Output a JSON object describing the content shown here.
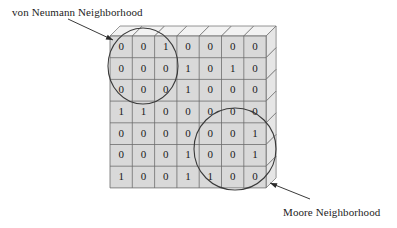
{
  "figure": {
    "type": "cellular-automaton-grid-diagram",
    "background_color": "#ffffff"
  },
  "annotations": {
    "von_neumann": {
      "label": "von Neumann Neighborhood",
      "circle": {
        "cx": 143,
        "cy": 66,
        "rx": 35,
        "ry": 38
      },
      "arrow": {
        "x1": 68,
        "y1": 19,
        "x2": 113,
        "y2": 40
      }
    },
    "moore": {
      "label": "Moore Neighborhood",
      "circle": {
        "cx": 235,
        "cy": 149,
        "rx": 41,
        "ry": 41
      },
      "arrow": {
        "x1": 310,
        "y1": 199,
        "x2": 270,
        "y2": 183
      }
    }
  },
  "grid": {
    "rows": 7,
    "cols": 7,
    "origin_x": 110,
    "origin_y": 36,
    "cell_w": 22.3,
    "cell_h": 21.7,
    "depth": 10,
    "cell_fill": "#d9d9d9",
    "top_face_fill": "#f2f2f2",
    "side_face_fill": "#e6e6e6",
    "stroke": "#6b6b6b",
    "values": [
      [
        "0",
        "0",
        "1",
        "0",
        "0",
        "0",
        "0"
      ],
      [
        "0",
        "0",
        "0",
        "1",
        "0",
        "1",
        "0"
      ],
      [
        "0",
        "0",
        "0",
        "1",
        "0",
        "0",
        "0"
      ],
      [
        "1",
        "1",
        "0",
        "0",
        "0",
        "0",
        "0"
      ],
      [
        "0",
        "0",
        "0",
        "0",
        "0",
        "0",
        "1"
      ],
      [
        "0",
        "0",
        "0",
        "1",
        "0",
        "0",
        "1"
      ],
      [
        "1",
        "0",
        "0",
        "1",
        "1",
        "0",
        "0"
      ]
    ]
  },
  "colors": {
    "ink": "#1a1a1a",
    "grid_line": "#6b6b6b",
    "annotation_line": "#3a3a3a"
  }
}
